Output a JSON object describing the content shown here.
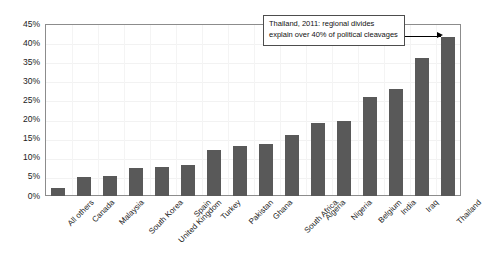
{
  "chart_data": {
    "type": "bar",
    "title": "",
    "subtitle": "",
    "xlabel": "",
    "ylabel": "",
    "ylim": [
      0,
      45
    ],
    "ytick_labels": [
      "0%",
      "5%",
      "10%",
      "15%",
      "20%",
      "25%",
      "30%",
      "35%",
      "40%",
      "45%"
    ],
    "ytick_values": [
      0,
      5,
      10,
      15,
      20,
      25,
      30,
      35,
      40,
      45
    ],
    "grid": true,
    "legend": "none",
    "bar_color": "#595959",
    "categories": [
      "All others",
      "Canada",
      "Malaysia",
      "South Korea",
      "United Kingdom",
      "Spain",
      "Turkey",
      "Pakistan",
      "Ghana",
      "South Africa",
      "Algeria",
      "Nigeria",
      "Belgium",
      "India",
      "Iraq",
      "Thailand"
    ],
    "values": [
      2,
      5,
      5.2,
      7.4,
      7.5,
      8,
      12,
      13,
      13.5,
      16,
      19,
      19.5,
      26,
      28,
      36,
      41.5
    ],
    "annotations": [
      {
        "lines": [
          "Thailand, 2011: regional divides",
          "explain over 40% of political cleavages"
        ],
        "points_to": "Thailand"
      }
    ]
  }
}
